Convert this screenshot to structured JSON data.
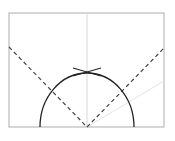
{
  "diagram": {
    "colors": {
      "frame": "#bbbbbb",
      "guide": "#d8d8d8",
      "faint_ray": "#e4e4e4",
      "arc": "#222222",
      "dashed": "#444444"
    },
    "frame": {
      "x": 9,
      "y": 13,
      "width": 155,
      "height": 114
    },
    "center": {
      "x": 87,
      "y": 127
    },
    "arc": {
      "rx": 47,
      "ry": 54
    },
    "vertical_guide": {
      "x": 87,
      "y1": 13,
      "y2": 127
    },
    "dashed_lines": [
      {
        "x1": 9,
        "y1": 47,
        "x2": 87,
        "y2": 127
      },
      {
        "x1": 87,
        "y1": 127,
        "x2": 164,
        "y2": 48
      }
    ],
    "faint_ray": {
      "x1": 87,
      "y1": 127,
      "x2": 164,
      "y2": 81
    },
    "intersection_mark": {
      "x": 87,
      "y": 72
    }
  }
}
